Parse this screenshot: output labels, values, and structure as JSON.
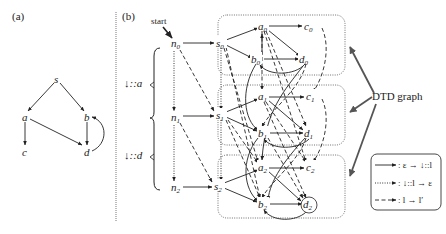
{
  "panel_a": {
    "label": "(a)",
    "nodes": [
      {
        "id": "s",
        "label": "s",
        "x": 57,
        "y": 80
      },
      {
        "id": "a",
        "label": "a",
        "x": 25,
        "y": 118
      },
      {
        "id": "b",
        "label": "b",
        "x": 87,
        "y": 118
      },
      {
        "id": "c",
        "label": "c",
        "x": 25,
        "y": 153
      },
      {
        "id": "d",
        "label": "d",
        "x": 87,
        "y": 153
      }
    ],
    "edges": [
      [
        "s",
        "a"
      ],
      [
        "s",
        "b"
      ],
      [
        "a",
        "c"
      ],
      [
        "a",
        "d"
      ],
      [
        "b",
        "d"
      ],
      [
        "d",
        "b"
      ]
    ]
  },
  "panel_b": {
    "label": "(b)",
    "start_label": "start",
    "step_labels": [
      {
        "text": "↓::a",
        "x": 125,
        "y": 86
      },
      {
        "text": "↓::d",
        "x": 125,
        "y": 158
      }
    ],
    "n_nodes": [
      {
        "base": "n",
        "sub": "0"
      },
      {
        "base": "n",
        "sub": "1"
      },
      {
        "base": "n",
        "sub": "2"
      }
    ],
    "layers": [
      {
        "s": {
          "base": "s",
          "sub": "0"
        },
        "a": {
          "base": "a",
          "sub": "0"
        },
        "b": {
          "base": "b",
          "sub": "0"
        },
        "c": {
          "base": "c",
          "sub": "0"
        },
        "d": {
          "base": "d",
          "sub": "0"
        }
      },
      {
        "s": {
          "base": "s",
          "sub": "1"
        },
        "a": {
          "base": "a",
          "sub": "1"
        },
        "b": {
          "base": "b",
          "sub": "1"
        },
        "c": {
          "base": "c",
          "sub": "1"
        },
        "d": {
          "base": "d",
          "sub": "1"
        }
      },
      {
        "s": {
          "base": "s",
          "sub": "2"
        },
        "a": {
          "base": "a",
          "sub": "2"
        },
        "b": {
          "base": "b",
          "sub": "2"
        },
        "c": {
          "base": "c",
          "sub": "2"
        },
        "d": {
          "base": "d",
          "sub": "2"
        }
      }
    ],
    "accepting_node": "d2",
    "callout": "DTD graph",
    "legend": [
      {
        "style": "solid",
        "text": ": ε → ↓::l"
      },
      {
        "style": "dotted",
        "text": ": ↓::l → ε"
      },
      {
        "style": "dashed",
        "text": ": l → l′"
      }
    ]
  }
}
